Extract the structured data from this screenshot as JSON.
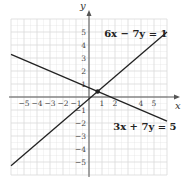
{
  "chart_data": {
    "type": "line",
    "title": "",
    "xlabel": "x",
    "ylabel": "y",
    "xlim": [
      -6,
      6
    ],
    "ylim": [
      -6,
      6
    ],
    "grid": true,
    "x_tick_labels": [
      {
        "value": -5,
        "label": "−5"
      },
      {
        "value": -4,
        "label": "−4"
      },
      {
        "value": -3,
        "label": "−3"
      },
      {
        "value": -2,
        "label": "−2"
      },
      {
        "value": -1,
        "label": "−1"
      },
      {
        "value": 1,
        "label": "1"
      },
      {
        "value": 2,
        "label": "2"
      },
      {
        "value": 4,
        "label": "4"
      },
      {
        "value": 5,
        "label": "5"
      }
    ],
    "y_tick_labels": [
      {
        "value": 5,
        "label": "5"
      },
      {
        "value": 4,
        "label": "4"
      },
      {
        "value": 3,
        "label": "3"
      },
      {
        "value": 2,
        "label": "2"
      },
      {
        "value": 1,
        "label": "1"
      },
      {
        "value": -1,
        "label": "−1"
      },
      {
        "value": -2,
        "label": "−2"
      },
      {
        "value": -3,
        "label": "−3"
      },
      {
        "value": -4,
        "label": "−4"
      },
      {
        "value": -5,
        "label": "−5"
      }
    ],
    "series": [
      {
        "name": "6x − 7y = 1",
        "label": "6x − 7y = 1",
        "slope": 0.857142857,
        "intercept": -0.142857143,
        "x": [
          -6,
          6
        ],
        "y": [
          -5.2857,
          5.0
        ],
        "label_at": [
          3.6,
          4.6
        ]
      },
      {
        "name": "3x + 7y = 5",
        "label": "3x + 7y = 5",
        "slope": -0.428571429,
        "intercept": 0.714285714,
        "x": [
          -6,
          6
        ],
        "y": [
          3.2857,
          -1.8571
        ],
        "label_at": [
          4.3,
          -2.55
        ]
      }
    ],
    "points": [
      {
        "name": "intersection",
        "x": 0.6667,
        "y": 0.4286
      }
    ],
    "colors": {
      "line": "#222222",
      "grid": "#d9d9d9",
      "axis": "#555555"
    }
  }
}
